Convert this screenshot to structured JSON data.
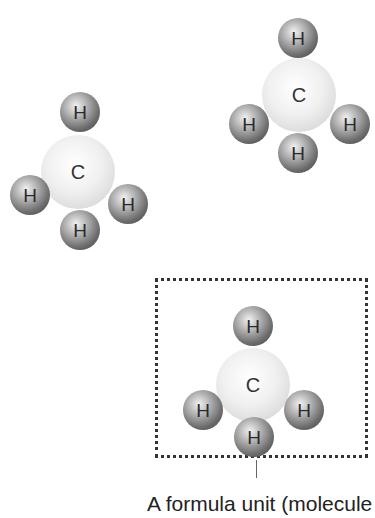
{
  "molecules": [
    {
      "carbon": "C",
      "hydrogens": [
        "H",
        "H",
        "H",
        "H"
      ]
    },
    {
      "carbon": "C",
      "hydrogens": [
        "H",
        "H",
        "H",
        "H"
      ]
    },
    {
      "carbon": "C",
      "hydrogens": [
        "H",
        "H",
        "H",
        "H"
      ]
    }
  ],
  "caption": "A formula unit (molecule"
}
